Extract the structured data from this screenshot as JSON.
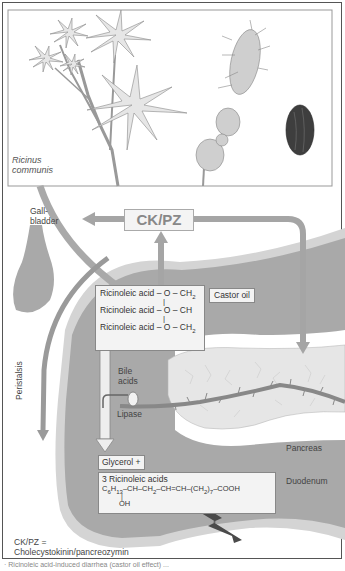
{
  "plant": {
    "species_line1": "Ricinus",
    "species_line2": "communis"
  },
  "labels": {
    "gallbladder_line1": "Gall-",
    "gallbladder_line2": "bladder",
    "ckpz": "CK/PZ",
    "castor_oil": "Castor oil",
    "bile_acids_line1": "Bile",
    "bile_acids_line2": "acids",
    "lipase": "Lipase",
    "peristalsis": "Peristalsis",
    "pancreas": "Pancreas",
    "duodenum": "Duodenum",
    "glycerol": "Glycerol +"
  },
  "triglyceride": {
    "row1_prefix": "Ricinoleic acid – O – CH",
    "row1_sub": "2",
    "row2": "Ricinoleic acid – O – CH",
    "row3_prefix": "Ricinoleic acid – O – CH",
    "row3_sub": "2",
    "bond": "|"
  },
  "ricinoleic": {
    "title": "3 Ricinoleic acids",
    "formula_c": "C",
    "formula_c_sub": "6",
    "formula_h": "H",
    "formula_h_sub": "13",
    "formula_mid1": "–CH–CH",
    "formula_ch2_sub": "2",
    "formula_mid2": "–CH=CH–(CH",
    "formula_ch2b_sub": "2",
    "formula_end": ")",
    "formula_n_sub": "7",
    "formula_tail": "–COOH",
    "bond": "|",
    "oh": "OH"
  },
  "legend": {
    "line1": "CK/PZ =",
    "line2": "Cholecystokinin/pancreozymin"
  },
  "caption": "· Ricinoleic acid-induced diarrhea (castor oil effect) ...",
  "colors": {
    "duodenum_fill": "#a9a9a9",
    "duodenum_edge": "#d4d4d4",
    "pancreas_fill": "#e4e4e4",
    "arrow": "#9a9a9a",
    "duct": "#8a8a8a",
    "box_fill": "#f3f3f3",
    "bolt": "#4a4a4a"
  }
}
